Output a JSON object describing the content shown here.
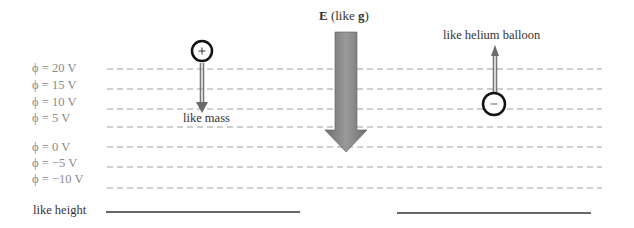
{
  "title": {
    "e_symbol": "E",
    "e_rest": " (like ",
    "g_symbol": "g",
    "close": ")"
  },
  "potential_levels": [
    {
      "label": "ϕ = 20 V",
      "y": 68
    },
    {
      "label": "ϕ = 15 V",
      "y": 88
    },
    {
      "label": "ϕ = 10 V",
      "y": 108
    },
    {
      "label": "ϕ = 5 V",
      "y": 125
    },
    {
      "label": "ϕ = 0 V",
      "y": 145
    },
    {
      "label": "ϕ = −5 V",
      "y": 165
    },
    {
      "label": "ϕ = −10 V",
      "y": 187
    }
  ],
  "positive_charge": {
    "symbol": "+",
    "caption": "like mass"
  },
  "negative_charge": {
    "symbol": "−",
    "caption": "like helium balloon"
  },
  "height_label": "like height",
  "colors": {
    "dash": "#9a9a9a",
    "arrow_fill": "#7a7a7a",
    "thin_arrow": "#666666",
    "text": "#333333",
    "level_text": "#8a8a8a"
  }
}
